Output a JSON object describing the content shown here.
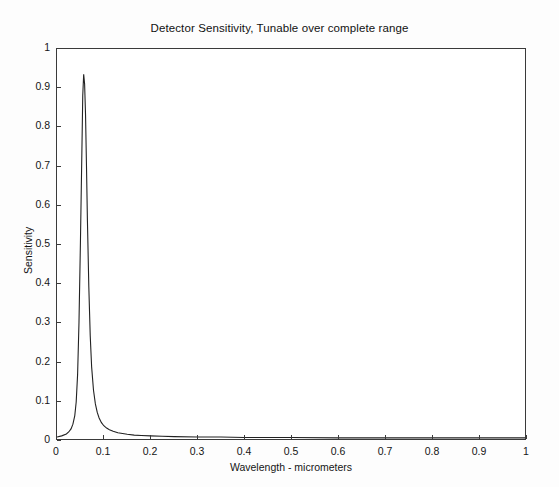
{
  "chart_data": {
    "type": "line",
    "title": "Detector Sensitivity, Tunable over complete range",
    "xlabel": "Wavelength - micrometers",
    "ylabel": "Sensitivity",
    "xlim": [
      0,
      1
    ],
    "ylim": [
      0,
      1
    ],
    "grid": false,
    "legend": "none",
    "line_color": "#222222",
    "xticks": [
      "0",
      "0.1",
      "0.2",
      "0.3",
      "0.4",
      "0.5",
      "0.6",
      "0.7",
      "0.8",
      "0.9",
      "1"
    ],
    "xtick_values": [
      0,
      0.1,
      0.2,
      0.3,
      0.4,
      0.5,
      0.6,
      0.7,
      0.8,
      0.9,
      1
    ],
    "yticks": [
      "0",
      "0.1",
      "0.2",
      "0.3",
      "0.4",
      "0.5",
      "0.6",
      "0.7",
      "0.8",
      "0.9",
      "1"
    ],
    "ytick_values": [
      0,
      0.1,
      0.2,
      0.3,
      0.4,
      0.5,
      0.6,
      0.7,
      0.8,
      0.9,
      1
    ],
    "series": [
      {
        "name": "Detector sensitivity",
        "peak_x": 0.057,
        "peak_y": 0.935,
        "x": [
          0.0,
          0.01,
          0.02,
          0.025,
          0.03,
          0.034,
          0.038,
          0.041,
          0.044,
          0.047,
          0.05,
          0.052,
          0.054,
          0.055,
          0.057,
          0.059,
          0.061,
          0.063,
          0.065,
          0.068,
          0.071,
          0.074,
          0.078,
          0.082,
          0.086,
          0.09,
          0.095,
          0.1,
          0.106,
          0.112,
          0.12,
          0.13,
          0.14,
          0.15,
          0.165,
          0.18,
          0.2,
          0.225,
          0.25,
          0.3,
          0.35,
          0.4,
          0.5,
          0.6,
          0.7,
          0.8,
          0.9,
          1.0
        ],
        "y": [
          0.005,
          0.008,
          0.013,
          0.018,
          0.026,
          0.038,
          0.06,
          0.095,
          0.165,
          0.3,
          0.5,
          0.65,
          0.8,
          0.88,
          0.935,
          0.91,
          0.83,
          0.7,
          0.56,
          0.39,
          0.265,
          0.185,
          0.125,
          0.09,
          0.068,
          0.054,
          0.042,
          0.034,
          0.028,
          0.024,
          0.02,
          0.016,
          0.014,
          0.012,
          0.01,
          0.009,
          0.008,
          0.007,
          0.006,
          0.005,
          0.005,
          0.004,
          0.004,
          0.003,
          0.003,
          0.003,
          0.003,
          0.003
        ]
      }
    ]
  }
}
